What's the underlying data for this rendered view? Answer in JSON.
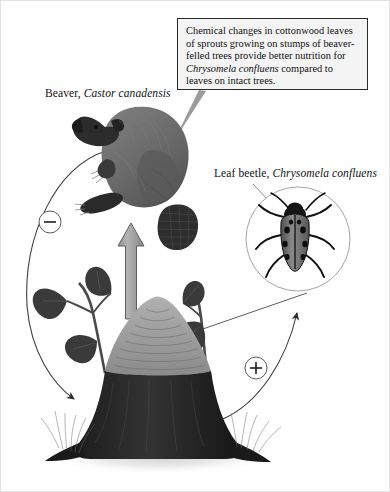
{
  "diagram": {
    "callout": {
      "line1": "Chemical changes in cottonwood",
      "line2": "leaves of sprouts growing on stumps",
      "line3": "of beaver-felled trees provide better",
      "line4_prefix": "nutrition for ",
      "line4_sci": "Chrysomela confluens",
      "line5": "compared to leaves on intact trees.",
      "border_color": "#2a2a2a",
      "fill_color": "#f4f4f4"
    },
    "labels": {
      "beaver_common": "Beaver, ",
      "beaver_sci": "Castor canadensis",
      "beetle_common": "Leaf beetle, ",
      "beetle_sci": "Chrysomela confluens"
    },
    "signs": {
      "negative": "−",
      "positive": "+"
    },
    "colors": {
      "beaver_body": "#6e6e6e",
      "beaver_dark": "#2b2b2b",
      "stump_bark": "#262626",
      "stump_cut": "#9a9a9a",
      "leaf": "#3a3a3a",
      "arrow_fill": "#9e9e9e",
      "arrow_stroke": "#5a5a5a",
      "line": "#4a4a4a",
      "background": "#ffffff"
    }
  }
}
